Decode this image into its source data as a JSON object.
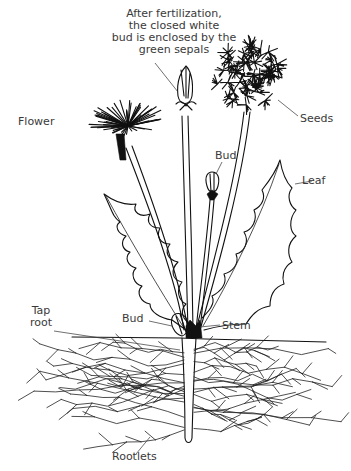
{
  "figure": {
    "labels": {
      "caption_line1": "After fertilization,",
      "caption_line2": "the closed white",
      "caption_line3": "bud is enclosed by the",
      "caption_line4": "green sepals",
      "flower": "Flower",
      "seeds": "Seeds",
      "bud_upper": "Bud",
      "leaf": "Leaf",
      "tap_root_line1": "Tap",
      "tap_root_line2": "root",
      "bud_lower": "Bud",
      "stem": "Stem",
      "rootlets": "Rootlets"
    },
    "colors": {
      "ink": "#111111",
      "label_text": "#3a3a3a",
      "background": "#ffffff"
    }
  }
}
